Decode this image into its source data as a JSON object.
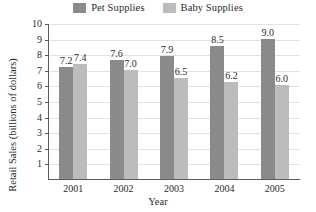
{
  "chart_data": {
    "type": "bar",
    "title": "",
    "xlabel": "Year",
    "ylabel": "Retail Sales (billions of dollars)",
    "categories": [
      "2001",
      "2002",
      "2003",
      "2004",
      "2005"
    ],
    "series": [
      {
        "name": "Pet Supplies",
        "color": "#8a8a8a",
        "values": [
          7.2,
          7.6,
          7.9,
          8.5,
          9.0
        ],
        "labels": [
          "7.2",
          "7.6",
          "7.9",
          "8.5",
          "9.0"
        ]
      },
      {
        "name": "Baby Supplies",
        "color": "#bcbcbc",
        "values": [
          7.4,
          7.0,
          6.5,
          6.2,
          6.0
        ],
        "labels": [
          "7.4",
          "7.0",
          "6.5",
          "6.2",
          "6.0"
        ]
      }
    ],
    "ylim": [
      0,
      10
    ],
    "yticks": [
      1,
      2,
      3,
      4,
      5,
      6,
      7,
      8,
      9,
      10
    ],
    "ytick_labels": [
      "1",
      "2",
      "3",
      "4",
      "5",
      "6",
      "7",
      "8",
      "9",
      "10"
    ],
    "grid": true,
    "grid_axis": "y",
    "legend_position": "top-center"
  },
  "legend": {
    "entries": [
      {
        "label": "Pet Supplies",
        "swatch": "#8a8a8a",
        "icon": "legend-swatch-icon"
      },
      {
        "label": "Baby Supplies",
        "swatch": "#bcbcbc",
        "icon": "legend-swatch-icon"
      }
    ]
  }
}
